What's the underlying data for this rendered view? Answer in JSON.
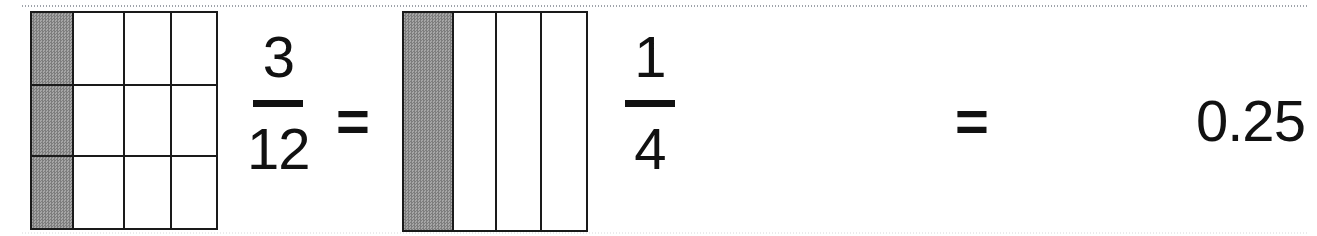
{
  "page": {
    "width": 1317,
    "height": 236,
    "background_color": "#ffffff",
    "ink_color": "#111111",
    "shade_color": "#8f8f8f"
  },
  "equation": {
    "statement": "3/12 = 1/4 = 0.25",
    "equals_1": "=",
    "equals_2": "=",
    "decimal_result": "0.25"
  },
  "models": [
    {
      "name": "twelfths-grid",
      "columns": 4,
      "rows": 3,
      "total_cells": 12,
      "shaded_cells": 3,
      "shaded_column_index": 1,
      "fraction": "3/12"
    },
    {
      "name": "fourths-grid",
      "columns": 4,
      "rows": 1,
      "total_cells": 4,
      "shaded_cells": 1,
      "shaded_column_index": 1,
      "fraction": "1/4"
    }
  ],
  "fractions": {
    "three_twelfths": {
      "numerator": "3",
      "denominator": "12"
    },
    "one_fourth": {
      "numerator": "1",
      "denominator": "4"
    }
  }
}
